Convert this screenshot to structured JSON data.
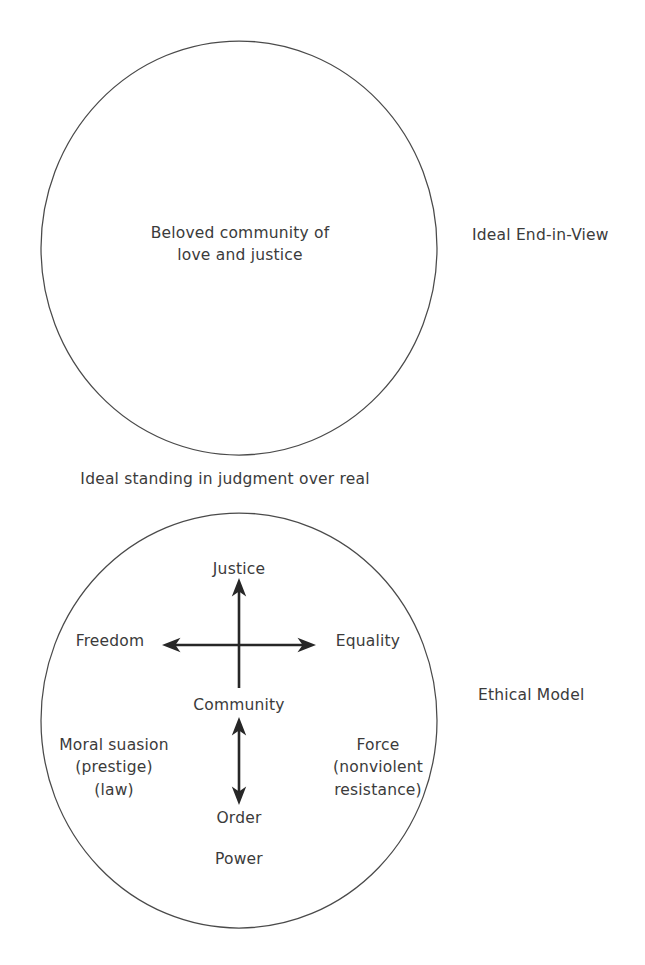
{
  "diagram": {
    "stroke_color": "#404040",
    "text_color": "#3b3b3b",
    "background_color": "#ffffff",
    "top_circle": {
      "name": "ideal-end-in-view-circle",
      "inner_text": "Beloved community of\nlove and justice",
      "side_label": "Ideal End-in-View"
    },
    "middle_caption": "Ideal standing in judgment over real",
    "bottom_circle": {
      "name": "ethical-model-circle",
      "side_label": "Ethical Model",
      "axis_top": "Justice",
      "axis_left": "Freedom",
      "axis_right": "Equality",
      "axis_center": "Community",
      "axis_bottom": "Order",
      "base_label": "Power",
      "left_block": "Moral suasion\n(prestige)\n(law)",
      "right_block": "Force\n(nonviolent\nresistance)"
    },
    "arrows": [
      {
        "name": "justice-arrow",
        "direction": "up",
        "from": "Community",
        "to": "Justice"
      },
      {
        "name": "freedom-equality-arrow",
        "direction": "double-horizontal",
        "from": "Freedom",
        "to": "Equality"
      },
      {
        "name": "community-order-arrow",
        "direction": "double-vertical",
        "from": "Community",
        "to": "Order"
      }
    ]
  }
}
